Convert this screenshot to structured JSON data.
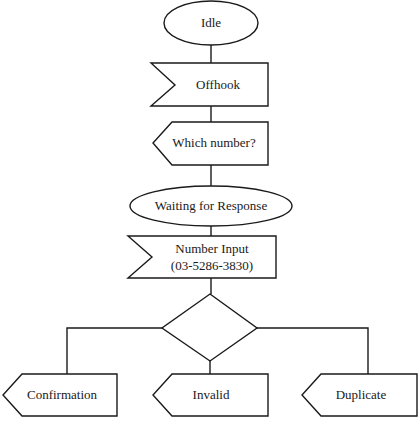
{
  "diagram": {
    "type": "flowchart",
    "nodes": {
      "idle": {
        "label": "Idle",
        "shape": "ellipse"
      },
      "offhook": {
        "label": "Offhook",
        "shape": "receive-signal"
      },
      "which_number": {
        "label": "Which number?",
        "shape": "send-signal"
      },
      "waiting": {
        "label": "Waiting for Response",
        "shape": "ellipse"
      },
      "number_input": {
        "label_line1": "Number Input",
        "label_line2": "(03-5286-3830)",
        "shape": "receive-signal"
      },
      "decision": {
        "label": "",
        "shape": "diamond"
      },
      "confirmation": {
        "label": "Confirmation",
        "shape": "send-signal"
      },
      "invalid": {
        "label": "Invalid",
        "shape": "send-signal"
      },
      "duplicate": {
        "label": "Duplicate",
        "shape": "send-signal"
      }
    },
    "edges": [
      [
        "idle",
        "offhook"
      ],
      [
        "offhook",
        "which_number"
      ],
      [
        "which_number",
        "waiting"
      ],
      [
        "waiting",
        "number_input"
      ],
      [
        "number_input",
        "decision"
      ],
      [
        "decision",
        "confirmation"
      ],
      [
        "decision",
        "invalid"
      ],
      [
        "decision",
        "duplicate"
      ]
    ]
  }
}
